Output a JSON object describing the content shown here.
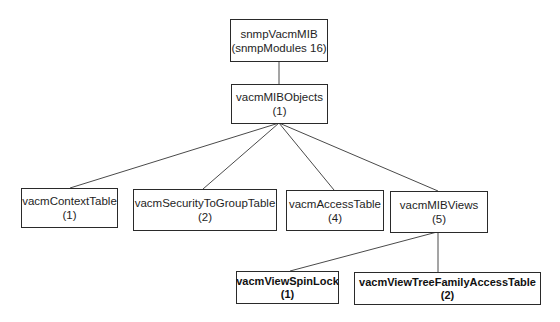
{
  "diagram": {
    "type": "tree",
    "nodes": {
      "root": {
        "name": "snmpVacmMIB",
        "sub": "(snmpModules 16)"
      },
      "objects": {
        "name": "vacmMIBObjects",
        "sub": "(1)"
      },
      "context_table": {
        "name": "vacmContextTable",
        "sub": "(1)"
      },
      "security_to_group_table": {
        "name": "vacmSecurityToGroupTable",
        "sub": "(2)"
      },
      "access_table": {
        "name": "vacmAccessTable",
        "sub": "(4)"
      },
      "mib_views": {
        "name": "vacmMIBViews",
        "sub": "(5)"
      },
      "view_spin_lock": {
        "name": "vacmViewSpinLock",
        "sub": "(1)"
      },
      "view_tree_family_access_table": {
        "name": "vacmViewTreeFamilyAccessTable",
        "sub": "(2)"
      }
    },
    "edges": [
      [
        "snmpVacmMIB",
        "vacmMIBObjects"
      ],
      [
        "vacmMIBObjects",
        "vacmContextTable"
      ],
      [
        "vacmMIBObjects",
        "vacmSecurityToGroupTable"
      ],
      [
        "vacmMIBObjects",
        "vacmAccessTable"
      ],
      [
        "vacmMIBObjects",
        "vacmMIBViews"
      ],
      [
        "vacmMIBViews",
        "vacmViewSpinLock"
      ],
      [
        "vacmMIBViews",
        "vacmViewTreeFamilyAccessTable"
      ]
    ],
    "colors": {
      "line": "#4a4a4a",
      "border": "#2a2a2a",
      "background": "#ffffff"
    }
  }
}
